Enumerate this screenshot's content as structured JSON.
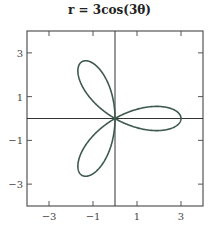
{
  "chart_data": {
    "type": "line",
    "subtype": "polar-rose",
    "title": "r = 3cos(3θ)",
    "equation": "r = 3cos(3θ)",
    "xlabel": "",
    "ylabel": "",
    "xlim": [
      -4,
      4
    ],
    "ylim": [
      -4,
      4
    ],
    "x_ticks": [
      -3,
      -1,
      1,
      3
    ],
    "y_ticks": [
      3,
      1,
      -1,
      -3
    ],
    "x_tick_labels": [
      "−3",
      "−1",
      "1",
      "3"
    ],
    "y_tick_labels": [
      "3",
      "1",
      "−1",
      "−3"
    ],
    "grid": false,
    "axes_lines_through_origin": true,
    "legend": null,
    "series": [
      {
        "name": "r = 3cos(3θ)",
        "amplitude": 3,
        "frequency": 3,
        "theta_range": [
          0,
          3.14159
        ],
        "petals": 3,
        "petal_tips": [
          [
            3,
            0
          ],
          [
            -1.5,
            2.598
          ],
          [
            -1.5,
            -2.598
          ]
        ],
        "color": "#3f5a4f"
      }
    ]
  },
  "colors": {
    "curve": "#3f5a4f",
    "frame": "#555555",
    "axes": "#333333"
  }
}
